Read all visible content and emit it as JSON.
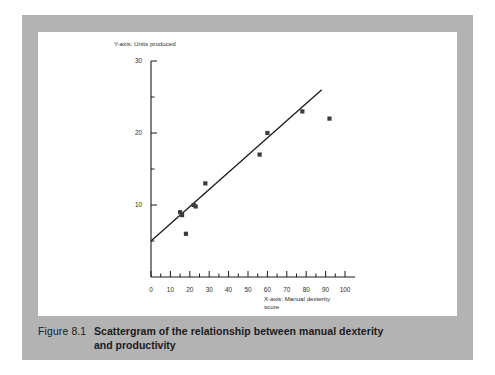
{
  "figure": {
    "number": "Figure 8.1",
    "caption_line1": "Scattergram of the relationship between manual dexterity",
    "caption_line2": "and productivity"
  },
  "chart_data": {
    "type": "scatter",
    "title": "",
    "xlabel_line1": "X-axis: Manual dexterity",
    "xlabel_line2": "score",
    "ylabel": "Y-axis: Units produced",
    "xlim": [
      0,
      100
    ],
    "ylim": [
      0,
      30
    ],
    "x_major_ticks": [
      0,
      10,
      20,
      30,
      40,
      50,
      60,
      70,
      80,
      90,
      100
    ],
    "x_tick_labels": [
      "0",
      "10",
      "20",
      "30",
      "40",
      "50",
      "60",
      "70",
      "80",
      "90",
      "100"
    ],
    "x_minor_step": 5,
    "y_major_ticks": [
      10,
      20,
      30
    ],
    "y_tick_labels": [
      "10",
      "20",
      "30"
    ],
    "y_minor_ticks": [
      5,
      15,
      25
    ],
    "grid": false,
    "legend": false,
    "marker": "square",
    "marker_color": "#3c3c3c",
    "line_color": "#1a1a1a",
    "points": [
      {
        "x": 15,
        "y": 9.0
      },
      {
        "x": 16,
        "y": 8.6
      },
      {
        "x": 18,
        "y": 6.0
      },
      {
        "x": 22,
        "y": 10.0
      },
      {
        "x": 23,
        "y": 9.8
      },
      {
        "x": 28,
        "y": 13.0
      },
      {
        "x": 56,
        "y": 17.0
      },
      {
        "x": 60,
        "y": 20.0
      },
      {
        "x": 78,
        "y": 23.0
      },
      {
        "x": 92,
        "y": 22.0
      }
    ],
    "trend_line": {
      "x_start": 0,
      "y_start": 5.0,
      "x_end": 88,
      "y_end": 26.0
    }
  }
}
